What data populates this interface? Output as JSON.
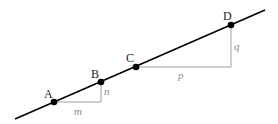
{
  "diagram": {
    "points": [
      {
        "label": "A",
        "x": 54,
        "y": 102
      },
      {
        "label": "B",
        "x": 101,
        "y": 82
      },
      {
        "label": "C",
        "x": 136,
        "y": 67
      },
      {
        "label": "D",
        "x": 231,
        "y": 25
      }
    ],
    "segments": [
      {
        "label": "m",
        "orientation": "horizontal"
      },
      {
        "label": "n",
        "orientation": "vertical"
      },
      {
        "label": "p",
        "orientation": "horizontal"
      },
      {
        "label": "q",
        "orientation": "vertical"
      }
    ],
    "colors": {
      "line": "#000000",
      "legs": "#a0a0a0"
    }
  }
}
